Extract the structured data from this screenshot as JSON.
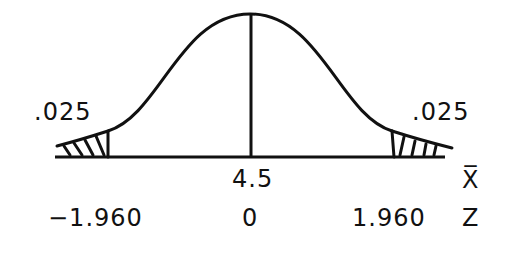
{
  "diagram": {
    "type": "normal-distribution-two-tailed",
    "tail_left_area": ".025",
    "tail_right_area": ".025",
    "mean_label": "4.5",
    "xbar_axis_label": "X̅",
    "z_axis_label": "Z",
    "z_left": "−1.960",
    "z_center": "0",
    "z_right": "1.960"
  }
}
